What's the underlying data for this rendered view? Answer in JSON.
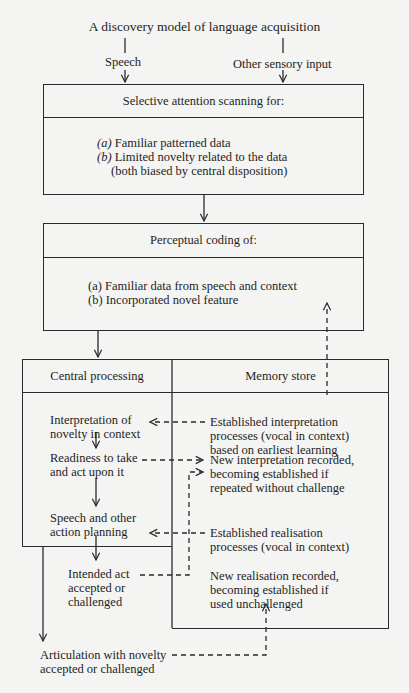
{
  "title": "A discovery model of language acquisition",
  "inputs": {
    "left": "Speech",
    "right": "Other sensory input"
  },
  "box1": {
    "header": "Selective attention scanning for:",
    "items": [
      {
        "label": "(a)",
        "text": "Familiar patterned data"
      },
      {
        "label": "(b)",
        "text": "Limited novelty related to the data"
      },
      {
        "label": "",
        "text": "(both biased by central disposition)"
      }
    ]
  },
  "box2": {
    "header": "Perceptual coding of:",
    "items": [
      {
        "text": "(a) Familiar data from speech and context"
      },
      {
        "text": "(b) Incorporated novel feature"
      }
    ]
  },
  "central": {
    "header": "Central processing",
    "steps": [
      [
        "Interpretation of",
        "novelty in context"
      ],
      [
        "Readiness to take",
        "and act upon it"
      ],
      [
        "Speech and other",
        "action planning"
      ],
      [
        "Intended act",
        "accepted or",
        "challenged"
      ]
    ]
  },
  "memory": {
    "header": "Memory store",
    "entries": [
      [
        "Established interpretation",
        "processes (vocal in context)",
        "based on earliest learning"
      ],
      [
        "New interpretation recorded,",
        "becoming established if",
        "repeated without challenge"
      ],
      [
        "Established realisation",
        "processes (vocal in context)"
      ],
      [
        "New realisation recorded,",
        "becoming established if",
        "used unchallenged"
      ]
    ]
  },
  "output": [
    "Articulation with novelty",
    "accepted or challenged"
  ]
}
